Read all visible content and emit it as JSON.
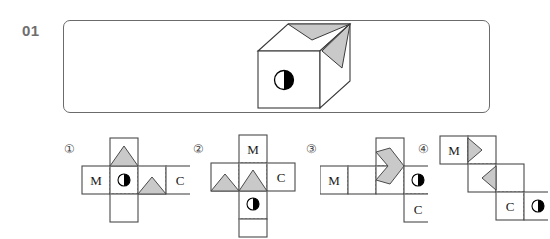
{
  "page": {
    "question_number": "01",
    "type": "cube-net-matching-question"
  },
  "stimulus": {
    "name": "reference-cube",
    "description": "Isometric cube with a gray arrow/triangle notch marking on the top face and the right face, and a half-filled circle on the front face.",
    "front_face_symbol": "half-filled-circle",
    "top_face_symbol": "gray-arrow-notch",
    "right_face_symbol": "gray-triangle"
  },
  "options": [
    {
      "id": "1",
      "label": "①",
      "net_shape": "cross",
      "faces": [
        "M",
        "half-circle",
        "C"
      ],
      "letters": {
        "left": "M",
        "right": "C"
      },
      "symbol": "half-filled-circle",
      "gray_marks": [
        "triangle-up-top-cell",
        "triangle-up-center-right"
      ]
    },
    {
      "id": "2",
      "label": "②",
      "net_shape": "cross-tall",
      "faces": [
        "M",
        "C",
        "half-circle"
      ],
      "letters": {
        "top": "M",
        "right": "C"
      },
      "symbol": "half-filled-circle",
      "gray_marks": [
        "triangle-up-left",
        "triangle-up-center"
      ]
    },
    {
      "id": "3",
      "label": "③",
      "net_shape": "zigzag",
      "faces": [
        "M",
        "half-circle",
        "C"
      ],
      "letters": {
        "left": "M",
        "bottom_right": "C"
      },
      "symbol": "half-filled-circle",
      "gray_marks": [
        "diamond-arrow-center"
      ]
    },
    {
      "id": "4",
      "label": "④",
      "net_shape": "staircase",
      "faces": [
        "M",
        "C",
        "half-circle"
      ],
      "letters": {
        "top_left": "M",
        "bottom": "C"
      },
      "symbol": "half-filled-circle",
      "gray_marks": [
        "arrow-right-top",
        "arrow-left-middle"
      ]
    }
  ],
  "colors": {
    "ink": "#333333",
    "border": "#6b6b6b",
    "gray_fill": "#c9c9c9",
    "label_gray": "#6e6e6e",
    "dashed": "#9a9a9a",
    "background": "#ffffff"
  }
}
